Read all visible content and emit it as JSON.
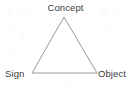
{
  "diagram": {
    "type": "semiotic-triangle",
    "title": "",
    "background_color": "#ffffff",
    "line_color": "#9a9a9a",
    "line_width": 1,
    "text_color": "#3c3c3c",
    "vertices": [
      {
        "id": "concept",
        "label": "Concept",
        "x": 64,
        "y": 17,
        "label_position": "top"
      },
      {
        "id": "sign",
        "label": "Sign",
        "x": 32,
        "y": 73,
        "label_position": "bottom-left"
      },
      {
        "id": "object",
        "label": "Object",
        "x": 97,
        "y": 73,
        "label_position": "bottom-right"
      }
    ],
    "edges": [
      {
        "id": "sign-concept",
        "from": "sign",
        "to": "concept",
        "label": ""
      },
      {
        "id": "concept-object",
        "from": "concept",
        "to": "object",
        "label": ""
      },
      {
        "id": "sign-object",
        "from": "sign",
        "to": "object",
        "label": ""
      }
    ]
  }
}
